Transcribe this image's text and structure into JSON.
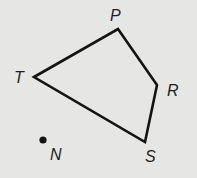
{
  "diagram": {
    "background": "#e6e6e4",
    "stroke_color": "#141414",
    "quadrilateral": {
      "name": "TPRS",
      "vertices": [
        {
          "id": "T",
          "label": "T",
          "x": 34,
          "y": 77,
          "label_x": 14,
          "label_y": 83
        },
        {
          "id": "P",
          "label": "P",
          "x": 118,
          "y": 29,
          "label_x": 110,
          "label_y": 21
        },
        {
          "id": "R",
          "label": "R",
          "x": 157,
          "y": 85,
          "label_x": 167,
          "label_y": 96
        },
        {
          "id": "S",
          "label": "S",
          "x": 145,
          "y": 142,
          "label_x": 145,
          "label_y": 162
        }
      ],
      "edges": [
        "TP",
        "PR",
        "RS",
        "ST"
      ]
    },
    "points": [
      {
        "id": "N",
        "label": "N",
        "x": 43,
        "y": 140,
        "label_x": 50,
        "label_y": 160
      }
    ]
  }
}
